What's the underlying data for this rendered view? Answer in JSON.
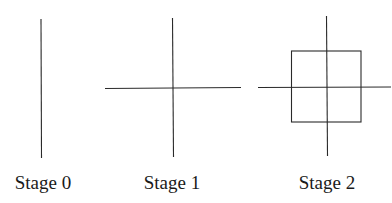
{
  "diagram": {
    "stages": [
      {
        "label": "Stage 0",
        "elements": [
          "vertical line"
        ]
      },
      {
        "label": "Stage 1",
        "elements": [
          "vertical line",
          "horizontal line"
        ]
      },
      {
        "label": "Stage 2",
        "elements": [
          "vertical line",
          "horizontal line",
          "square"
        ]
      }
    ],
    "line_color": "#2a2a2a",
    "text_color": "#1a1a1a"
  }
}
